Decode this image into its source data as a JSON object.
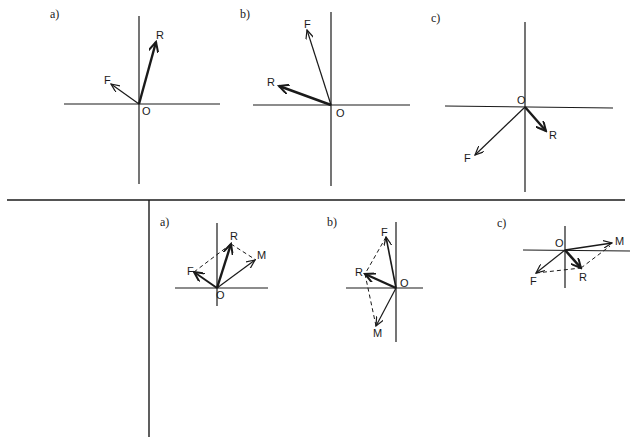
{
  "figure": {
    "top_row": {
      "panels": [
        {
          "id": "a",
          "label": "a)",
          "origin_label": "O",
          "vectors": [
            {
              "name": "R",
              "style": "bold"
            },
            {
              "name": "F",
              "style": "thin"
            }
          ]
        },
        {
          "id": "b",
          "label": "b)",
          "origin_label": "O",
          "vectors": [
            {
              "name": "F",
              "style": "thin"
            },
            {
              "name": "R",
              "style": "bold"
            }
          ]
        },
        {
          "id": "c",
          "label": "c)",
          "origin_label": "O",
          "vectors": [
            {
              "name": "R",
              "style": "bold"
            },
            {
              "name": "F",
              "style": "thin"
            }
          ]
        }
      ]
    },
    "bottom_row": {
      "panels": [
        {
          "id": "a",
          "label": "a)",
          "origin_label": "O",
          "vectors": [
            {
              "name": "R"
            },
            {
              "name": "M"
            },
            {
              "name": "F"
            }
          ],
          "construction": "parallelogram F-R-M dashed"
        },
        {
          "id": "b",
          "label": "b)",
          "origin_label": "O",
          "vectors": [
            {
              "name": "F"
            },
            {
              "name": "R"
            },
            {
              "name": "M"
            }
          ],
          "construction": "parallelogram F-R-M dashed"
        },
        {
          "id": "c",
          "label": "c)",
          "origin_label": "O",
          "vectors": [
            {
              "name": "M"
            },
            {
              "name": "R"
            },
            {
              "name": "F"
            }
          ],
          "construction": "parallelogram F-R-M dashed"
        }
      ]
    },
    "colors": {
      "ink": "#1a1a1a",
      "background": "#ffffff"
    }
  }
}
